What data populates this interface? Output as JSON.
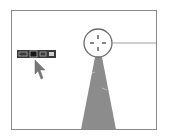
{
  "diagram": {
    "colors": {
      "frame": "#8a8a8a",
      "cone": "#8c8c8c",
      "toolbar": "#3a3a3a",
      "cursor": "#777777",
      "circle": "#6a6a6a"
    },
    "toolbar": {
      "buttons": [
        "move-tool",
        "selected-tool",
        "option-tool",
        "end-tool"
      ]
    }
  }
}
